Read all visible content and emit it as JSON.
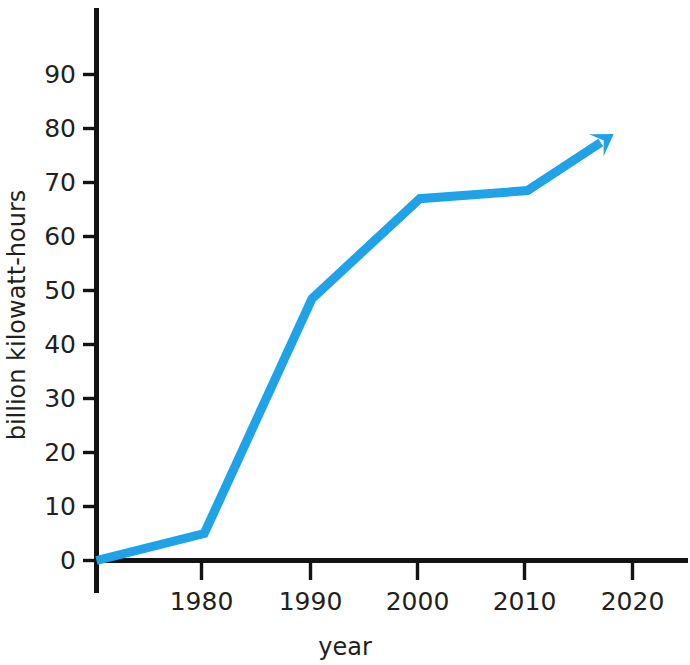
{
  "chart_data": {
    "type": "line",
    "title": "",
    "subtitle": "",
    "xlabel": "year",
    "ylabel": "billion kilowatt-hours",
    "xlim": [
      1970,
      2025
    ],
    "ylim": [
      0,
      97
    ],
    "grid": false,
    "legend": "none",
    "x_ticks": [
      1980,
      1990,
      2000,
      2010,
      2020
    ],
    "x_tick_labels": [
      "1980",
      "1990",
      "2000",
      "2010",
      "2020"
    ],
    "y_ticks": [
      0,
      10,
      20,
      30,
      40,
      50,
      60,
      70,
      80,
      90
    ],
    "y_tick_labels": [
      "0",
      "10",
      "20",
      "30",
      "40",
      "50",
      "60",
      "70",
      "80",
      "90"
    ],
    "series": [
      {
        "name": "billion kilowatt-hours",
        "color": "#1FA2E8",
        "line_width": 9,
        "arrow_end": true,
        "x": [
          1970,
          1980,
          1990,
          2000,
          2010,
          2018
        ],
        "values": [
          0,
          5,
          48.5,
          67,
          68.5,
          79
        ]
      }
    ],
    "annotations": []
  },
  "axes": {
    "y_title": "billion kilowatt-hours",
    "x_title": "year"
  },
  "colors": {
    "line": "#1FA2E8",
    "axis": "#131313",
    "text": "#231f20",
    "background": "#ffffff"
  }
}
